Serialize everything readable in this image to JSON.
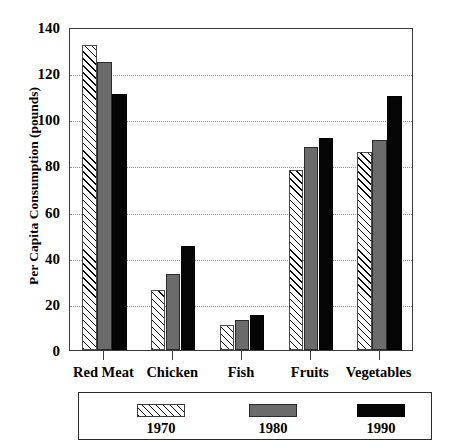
{
  "chart_data": {
    "type": "bar",
    "title": "",
    "xlabel": "",
    "ylabel": "Per Capita Consumption (pounds)",
    "ylim": [
      0,
      140
    ],
    "yticks": [
      0,
      20,
      40,
      60,
      80,
      100,
      120,
      140
    ],
    "ytick_labels": [
      "0",
      "20",
      "40",
      "60",
      "80",
      "100",
      "120",
      "140"
    ],
    "grid": "horizontal-dotted",
    "legend_position": "bottom",
    "categories": [
      "Red Meat",
      "Chicken",
      "Fish",
      "Fruits",
      "Vegetables"
    ],
    "series": [
      {
        "name": "1970",
        "style": "hatched",
        "color": "#ffffff",
        "values": [
          132,
          26,
          11,
          78,
          86
        ]
      },
      {
        "name": "1980",
        "style": "solid-gray",
        "color": "#6b6b6b",
        "values": [
          125,
          33,
          13,
          88,
          91
        ]
      },
      {
        "name": "1990",
        "style": "solid-black",
        "color": "#050505",
        "values": [
          111,
          45,
          15,
          92,
          110
        ]
      }
    ]
  },
  "legend": {
    "items": [
      {
        "label": "1970",
        "swatch": "hatched-swatch"
      },
      {
        "label": "1980",
        "swatch": "gray-swatch"
      },
      {
        "label": "1990",
        "swatch": "black-swatch"
      }
    ]
  }
}
